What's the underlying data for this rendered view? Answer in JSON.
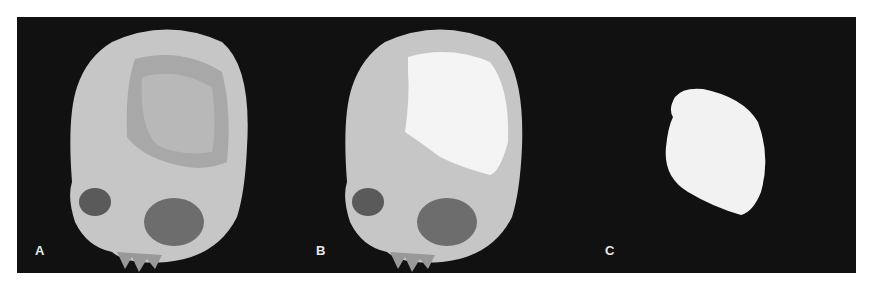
{
  "figure": {
    "background": "#ffffff",
    "panel_background": "#111111",
    "panels": [
      {
        "label": "A",
        "description": "3D CT reconstruction of skull with cranial defect exposing brain surface"
      },
      {
        "label": "B",
        "description": "Skull with white cranial implant fitted into defect"
      },
      {
        "label": "C",
        "description": "Isolated white cranial implant"
      }
    ],
    "colors": {
      "bone": "#c9c9c9",
      "implant": "#f4f4f4",
      "brain": "#b5b5b5"
    }
  }
}
